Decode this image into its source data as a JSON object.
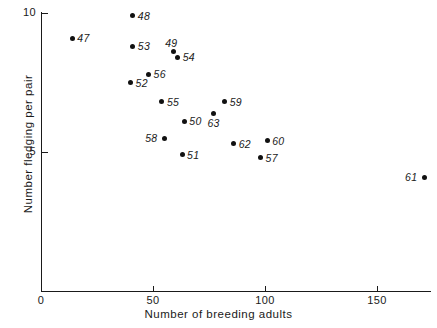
{
  "chart_data": {
    "type": "scatter",
    "title": "",
    "xlabel": "Number of breeding adults",
    "ylabel": "Number fledging per pair",
    "xlim": [
      0,
      174
    ],
    "ylim": [
      3.3,
      10.1
    ],
    "grid": false,
    "legend": null,
    "xticks": [
      {
        "value": 0,
        "label": "0"
      },
      {
        "value": 50,
        "label": "50"
      },
      {
        "value": 100,
        "label": "100"
      },
      {
        "value": 150,
        "label": "150"
      }
    ],
    "yticks": [
      {
        "value": 5,
        "label": "5"
      },
      {
        "value": 10,
        "label": "10"
      }
    ],
    "point_label_note": "Each point is annotated with a two-digit year label",
    "points": [
      {
        "label": "47",
        "x": 14,
        "y": 9.1,
        "label_pos": "right"
      },
      {
        "label": "48",
        "x": 41,
        "y": 9.9,
        "label_pos": "right"
      },
      {
        "label": "49",
        "x": 59,
        "y": 8.6,
        "label_pos": "above-left"
      },
      {
        "label": "50",
        "x": 64,
        "y": 6.1,
        "label_pos": "right"
      },
      {
        "label": "51",
        "x": 63,
        "y": 4.9,
        "label_pos": "right"
      },
      {
        "label": "52",
        "x": 40,
        "y": 7.5,
        "label_pos": "right"
      },
      {
        "label": "53",
        "x": 41,
        "y": 8.8,
        "label_pos": "right"
      },
      {
        "label": "54",
        "x": 61,
        "y": 8.4,
        "label_pos": "right"
      },
      {
        "label": "55",
        "x": 54,
        "y": 6.8,
        "label_pos": "right"
      },
      {
        "label": "56",
        "x": 48,
        "y": 7.8,
        "label_pos": "right"
      },
      {
        "label": "57",
        "x": 98,
        "y": 4.8,
        "label_pos": "right"
      },
      {
        "label": "58",
        "x": 55,
        "y": 5.5,
        "label_pos": "left"
      },
      {
        "label": "59",
        "x": 82,
        "y": 6.8,
        "label_pos": "right"
      },
      {
        "label": "60",
        "x": 101,
        "y": 5.4,
        "label_pos": "right"
      },
      {
        "label": "61",
        "x": 171,
        "y": 4.1,
        "label_pos": "left"
      },
      {
        "label": "62",
        "x": 86,
        "y": 5.3,
        "label_pos": "right"
      },
      {
        "label": "63",
        "x": 77,
        "y": 6.4,
        "label_pos": "below"
      }
    ]
  }
}
